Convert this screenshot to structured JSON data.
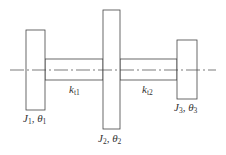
{
  "diagram": {
    "type": "three-disc torsional system",
    "colors": {
      "stroke": "#444444",
      "background": "#ffffff",
      "text": "#333333"
    },
    "center_line": {
      "x1": 10,
      "x2": 216,
      "y": 70,
      "style": "dash-dot"
    },
    "discs": [
      {
        "id": "disc-1",
        "symbol": "J",
        "index": "1",
        "angle_symbol": "θ",
        "x": 26,
        "y": 30,
        "w": 19,
        "h": 80,
        "label_x": 23,
        "label_y": 122
      },
      {
        "id": "disc-2",
        "symbol": "J",
        "index": "2",
        "angle_symbol": "θ",
        "x": 103,
        "y": 10,
        "w": 17,
        "h": 119,
        "label_x": 98,
        "label_y": 142
      },
      {
        "id": "disc-3",
        "symbol": "J",
        "index": "3",
        "angle_symbol": "θ",
        "x": 177,
        "y": 40,
        "w": 20,
        "h": 59,
        "label_x": 174,
        "label_y": 111
      }
    ],
    "shafts": [
      {
        "id": "shaft-1",
        "symbol": "k",
        "index": "t1",
        "x": 45,
        "y": 59,
        "w": 58,
        "h": 21,
        "label_x": 69,
        "label_y": 93
      },
      {
        "id": "shaft-2",
        "symbol": "k",
        "index": "t2",
        "x": 120,
        "y": 59,
        "w": 57,
        "h": 21,
        "label_x": 142,
        "label_y": 93
      }
    ]
  }
}
